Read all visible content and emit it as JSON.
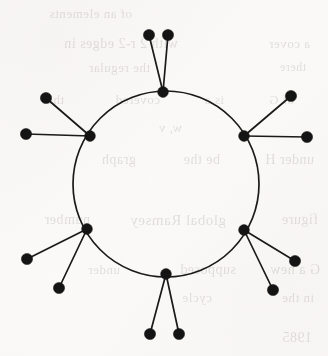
{
  "page": {
    "width": 328,
    "height": 356,
    "background_color": "#fdfcfa",
    "ink_color": "#141414",
    "edge_color": "#1a1a1a",
    "bleed_text_color": "#5d5348"
  },
  "figure": {
    "kind": "graph-diagram",
    "name": "sunlet-graph",
    "vertex_count": 18,
    "edge_count": 18,
    "cycle_length": 6,
    "pendants_per_hub": 2
  },
  "ring": {
    "center_x": 166,
    "center_y": 184,
    "radius": 93,
    "stroke_width": 1.7
  },
  "vertex_radius": {
    "hub": 5.4,
    "pendant": 5.6
  },
  "hubs": [
    {
      "id": "hub-top",
      "label": "top",
      "x": 163,
      "y": 92
    },
    {
      "id": "hub-upper-right",
      "label": "upper-right",
      "x": 244,
      "y": 136
    },
    {
      "id": "hub-lower-right",
      "label": "lower-right",
      "x": 244,
      "y": 230
    },
    {
      "id": "hub-bottom",
      "label": "bottom",
      "x": 166,
      "y": 274
    },
    {
      "id": "hub-lower-left",
      "label": "lower-left",
      "x": 87,
      "y": 229
    },
    {
      "id": "hub-upper-left",
      "label": "upper-left",
      "x": 90,
      "y": 136
    }
  ],
  "pendants": [
    {
      "id": "pendant-top-left",
      "hub": "hub-top",
      "x": 149,
      "y": 35
    },
    {
      "id": "pendant-top-right",
      "hub": "hub-top",
      "x": 168,
      "y": 35
    },
    {
      "id": "pendant-upper-right-up",
      "hub": "hub-upper-right",
      "x": 291,
      "y": 96
    },
    {
      "id": "pendant-upper-right-side",
      "hub": "hub-upper-right",
      "x": 307,
      "y": 137
    },
    {
      "id": "pendant-lower-right-side",
      "hub": "hub-lower-right",
      "x": 295,
      "y": 261
    },
    {
      "id": "pendant-lower-right-down",
      "hub": "hub-lower-right",
      "x": 273,
      "y": 290
    },
    {
      "id": "pendant-bottom-left",
      "hub": "hub-bottom",
      "x": 150,
      "y": 334
    },
    {
      "id": "pendant-bottom-right",
      "hub": "hub-bottom",
      "x": 179,
      "y": 334
    },
    {
      "id": "pendant-lower-left-down",
      "hub": "hub-lower-left",
      "x": 59,
      "y": 288
    },
    {
      "id": "pendant-lower-left-side",
      "hub": "hub-lower-left",
      "x": 27,
      "y": 259
    },
    {
      "id": "pendant-upper-left-side",
      "hub": "hub-upper-left",
      "x": 26,
      "y": 134
    },
    {
      "id": "pendant-upper-left-up",
      "hub": "hub-upper-left",
      "x": 46,
      "y": 98
    }
  ],
  "bleed_through_lines": [
    {
      "text": "of an elements",
      "x": 196,
      "y": 6,
      "size": 13
    },
    {
      "text": "with 2 r-2 edges in",
      "x": 150,
      "y": 36,
      "size": 14
    },
    {
      "text": "the regular",
      "x": 178,
      "y": 60,
      "size": 13
    },
    {
      "text": "a cover",
      "x": 18,
      "y": 36,
      "size": 13
    },
    {
      "text": "there",
      "x": 22,
      "y": 60,
      "size": 12
    },
    {
      "text": "of G",
      "x": 34,
      "y": 92,
      "size": 13
    },
    {
      "text": "is a ",
      "x": 104,
      "y": 92,
      "size": 13
    },
    {
      "text": "covered",
      "x": 168,
      "y": 92,
      "size": 13
    },
    {
      "text": "the",
      "x": 264,
      "y": 92,
      "size": 13
    },
    {
      "text": "w, v",
      "x": 146,
      "y": 120,
      "size": 13
    },
    {
      "text": "under H",
      "x": 14,
      "y": 152,
      "size": 14
    },
    {
      "text": "be the",
      "x": 108,
      "y": 152,
      "size": 14
    },
    {
      "text": "graph",
      "x": 192,
      "y": 152,
      "size": 14
    },
    {
      "text": "figure",
      "x": 10,
      "y": 212,
      "size": 14
    },
    {
      "text": "global Ramsey",
      "x": 102,
      "y": 212,
      "size": 15
    },
    {
      "text": "number",
      "x": 238,
      "y": 212,
      "size": 14
    },
    {
      "text": "G a new ",
      "x": 8,
      "y": 262,
      "size": 14
    },
    {
      "text": "supposed",
      "x": 92,
      "y": 262,
      "size": 14
    },
    {
      "text": "under",
      "x": 208,
      "y": 262,
      "size": 13
    },
    {
      "text": "in the",
      "x": 14,
      "y": 290,
      "size": 13
    },
    {
      "text": "cycle",
      "x": 116,
      "y": 290,
      "size": 13
    },
    {
      "text": "1985",
      "x": 16,
      "y": 330,
      "size": 14
    }
  ]
}
